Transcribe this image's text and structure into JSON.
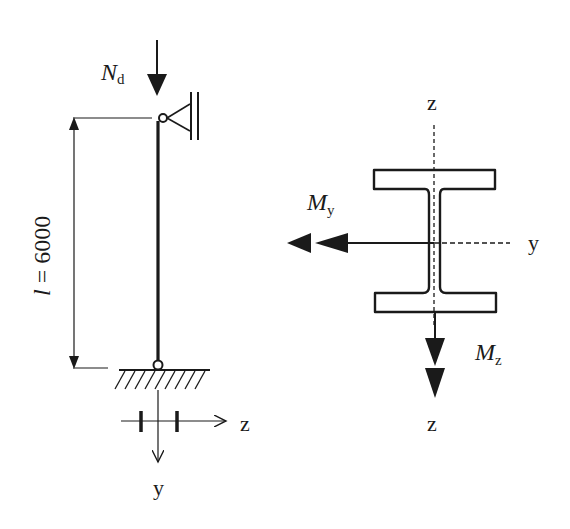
{
  "diagram": {
    "column": {
      "load_label": "N",
      "load_subscript": "d",
      "length_label_var": "l",
      "length_label_eq": " = 6000",
      "support_top": "lateral pin support",
      "support_bottom": "pinned base"
    },
    "local_axes": {
      "z_label": "z",
      "y_label": "y"
    },
    "section": {
      "type": "I-section",
      "axis_z_top": "z",
      "axis_z_bottom": "z",
      "axis_y": "y",
      "moment_y_label": "M",
      "moment_y_sub": "y",
      "moment_z_label": "M",
      "moment_z_sub": "z"
    },
    "colors": {
      "line": "#1a1a1a",
      "background": "#ffffff"
    }
  }
}
